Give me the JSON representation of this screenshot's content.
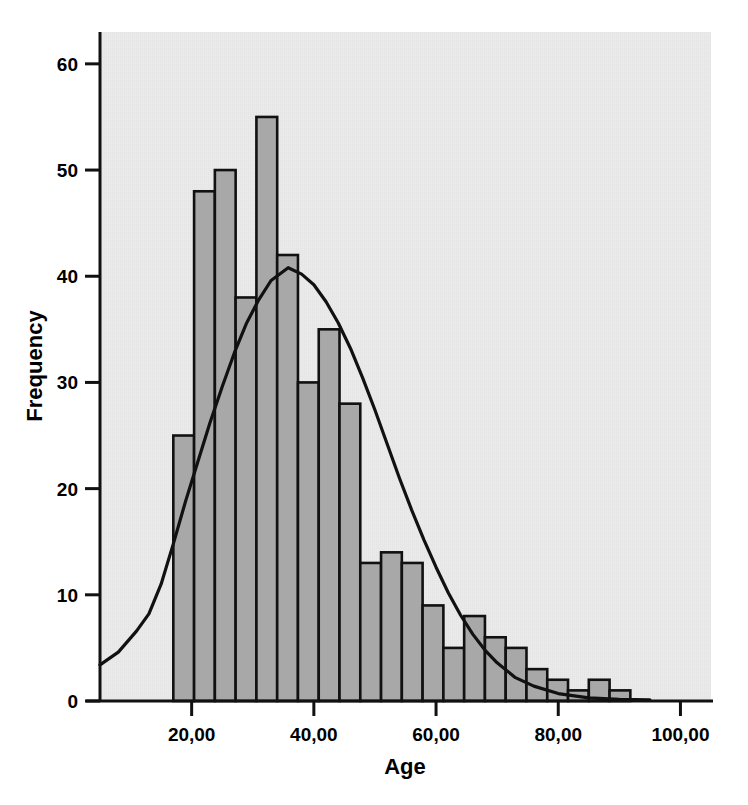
{
  "chart_data": {
    "type": "bar",
    "title": "",
    "subtitle": "",
    "xlabel": "Age",
    "ylabel": "Frequency",
    "xlim": [
      5.0,
      105.0
    ],
    "ylim": [
      0,
      63
    ],
    "grid": false,
    "legend": null,
    "x_tick_labels": [
      "20,00",
      "40,00",
      "60,00",
      "80,00",
      "100,00"
    ],
    "x_tick_values": [
      20,
      40,
      60,
      80,
      100
    ],
    "y_tick_labels": [
      "0",
      "10",
      "20",
      "30",
      "40",
      "50",
      "60"
    ],
    "y_tick_values": [
      0,
      10,
      20,
      30,
      40,
      50,
      60
    ],
    "bin_width": 3.4,
    "bin_starts": [
      17.0,
      20.4,
      23.8,
      27.2,
      30.6,
      34.0,
      37.4,
      40.8,
      44.2,
      47.6,
      51.0,
      54.4,
      57.8,
      61.2,
      64.6,
      68.0,
      71.4,
      74.8,
      78.2,
      81.6,
      85.0,
      88.4
    ],
    "categories": [
      "17,0",
      "20,4",
      "23,8",
      "27,2",
      "30,6",
      "34,0",
      "37,4",
      "40,8",
      "44,2",
      "47,6",
      "51,0",
      "54,4",
      "57,8",
      "61,2",
      "64,6",
      "68,0",
      "71,4",
      "74,8",
      "78,2",
      "81,6",
      "85,0",
      "88,4"
    ],
    "values": [
      25,
      48,
      50,
      38,
      55,
      42,
      30,
      35,
      28,
      13,
      14,
      13,
      9,
      5,
      8,
      6,
      5,
      3,
      2,
      1,
      2,
      1
    ],
    "overlay": {
      "name": "normal-curve",
      "type": "line",
      "peak_x": 35.8,
      "peak_y": 40.8,
      "x": [
        5.0,
        8.0,
        11.0,
        13.0,
        15.0,
        17.0,
        19.0,
        21.0,
        23.0,
        25.0,
        27.0,
        29.0,
        31.0,
        33.0,
        35.8,
        38.0,
        40.0,
        42.0,
        44.0,
        46.0,
        48.0,
        50.0,
        52.0,
        54.0,
        56.0,
        58.0,
        60.0,
        62.0,
        64.0,
        66.0,
        68.0,
        70.0,
        73.0,
        76.0,
        80.0,
        85.0,
        90.0,
        95.0
      ],
      "y": [
        3.4,
        4.6,
        6.6,
        8.2,
        11.0,
        14.8,
        18.8,
        22.5,
        26.2,
        29.6,
        32.8,
        35.6,
        37.8,
        39.6,
        40.8,
        40.2,
        39.2,
        37.6,
        35.6,
        33.2,
        30.4,
        27.4,
        24.2,
        21.0,
        18.0,
        15.2,
        12.6,
        10.2,
        8.1,
        6.3,
        4.8,
        3.6,
        2.2,
        1.4,
        0.7,
        0.3,
        0.15,
        0.1
      ]
    }
  }
}
